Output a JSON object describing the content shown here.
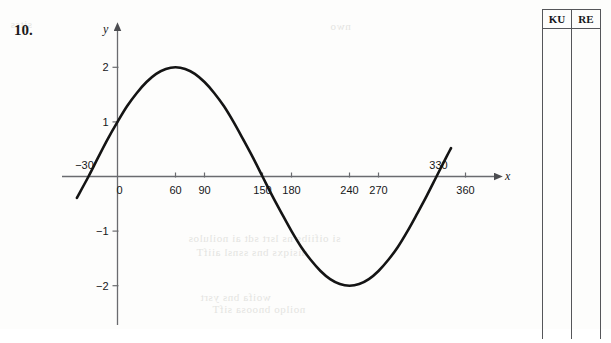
{
  "question": {
    "number": "10."
  },
  "chart_data": {
    "type": "line",
    "title": "",
    "xlabel": "x",
    "ylabel": "y",
    "function": "y = 2 sin(x + 30)",
    "amplitude": 2,
    "period": 360,
    "phase_shift_degrees": -30,
    "xlim": [
      -40,
      390
    ],
    "ylim": [
      -2.6,
      2.45
    ],
    "x_ticks": [
      0,
      60,
      90,
      150,
      180,
      240,
      270,
      360
    ],
    "x_tick_labels": [
      "0",
      "60",
      "90",
      "150",
      "180",
      "240",
      "270",
      "360"
    ],
    "y_ticks": [
      2,
      1,
      -1,
      -2
    ],
    "y_tick_labels": [
      "2",
      "1",
      "−1",
      "−2"
    ],
    "above_axis_labels": [
      {
        "value": -30,
        "label": "−30"
      },
      {
        "value": 330,
        "label": "330"
      }
    ],
    "grid": false,
    "legend": false,
    "x_domain_drawn": [
      -42,
      345
    ],
    "key_points": {
      "maximum": [
        60,
        2
      ],
      "minimum": [
        240,
        -2
      ],
      "zeros": [
        -30,
        150,
        330
      ],
      "y_intercept": 1
    },
    "points": [
      [
        -42,
        -0.39
      ],
      [
        -30,
        0.0
      ],
      [
        -20,
        0.35
      ],
      [
        -10,
        0.69
      ],
      [
        0,
        1.0
      ],
      [
        10,
        1.29
      ],
      [
        20,
        1.53
      ],
      [
        30,
        1.73
      ],
      [
        40,
        1.88
      ],
      [
        50,
        1.97
      ],
      [
        60,
        2.0
      ],
      [
        70,
        1.97
      ],
      [
        80,
        1.88
      ],
      [
        90,
        1.73
      ],
      [
        100,
        1.53
      ],
      [
        110,
        1.29
      ],
      [
        120,
        1.0
      ],
      [
        130,
        0.68
      ],
      [
        140,
        0.35
      ],
      [
        150,
        0.0
      ],
      [
        160,
        -0.35
      ],
      [
        170,
        -0.68
      ],
      [
        180,
        -1.0
      ],
      [
        190,
        -1.29
      ],
      [
        200,
        -1.53
      ],
      [
        210,
        -1.73
      ],
      [
        220,
        -1.88
      ],
      [
        230,
        -1.97
      ],
      [
        240,
        -2.0
      ],
      [
        250,
        -1.97
      ],
      [
        260,
        -1.88
      ],
      [
        270,
        -1.73
      ],
      [
        280,
        -1.53
      ],
      [
        290,
        -1.29
      ],
      [
        300,
        -1.0
      ],
      [
        310,
        -0.68
      ],
      [
        320,
        -0.35
      ],
      [
        330,
        0.0
      ],
      [
        340,
        0.35
      ],
      [
        345,
        0.52
      ]
    ]
  },
  "marks_table": {
    "columns": [
      {
        "header": "KU"
      },
      {
        "header": "RE"
      }
    ]
  },
  "bleedthrough": [
    {
      "text": "si oifiibs ns lsrt sdt ai noilulos",
      "x": 188,
      "y": 232
    },
    {
      "text": "nisiqxs bns ssnsl aiifT",
      "x": 196,
      "y": 246
    },
    {
      "text": "woifa bns ysrt",
      "x": 200,
      "y": 291
    },
    {
      "text": "noilqo bnoosa sifT",
      "x": 212,
      "y": 303
    },
    {
      "text": "sitss",
      "x": 10,
      "y": 18
    },
    {
      "text": "nwo",
      "x": 330,
      "y": 20
    }
  ]
}
